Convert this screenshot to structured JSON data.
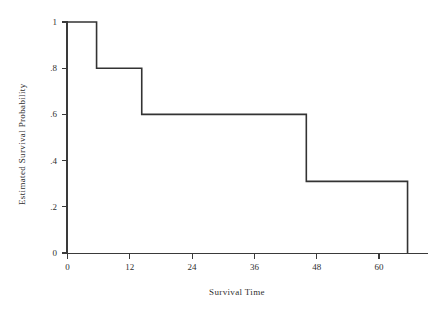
{
  "chart_data": {
    "type": "line",
    "subtype": "kaplan-meier-step",
    "title": "",
    "xlabel": "Survival Time",
    "ylabel": "Estimated Survival Probability",
    "xlim": [
      -2,
      68
    ],
    "ylim": [
      0,
      1.05
    ],
    "xticks": [
      0,
      12,
      24,
      36,
      48,
      60
    ],
    "xtick_labels": [
      "0",
      "12",
      "24",
      "36",
      "48",
      "60"
    ],
    "yticks": [
      0,
      0.2,
      0.4,
      0.6,
      0.8,
      1
    ],
    "ytick_labels": [
      "0",
      ".2",
      ".4",
      ".6",
      ".8",
      "1"
    ],
    "grid": false,
    "legend": false,
    "legend_position": "none",
    "series": [
      {
        "name": "Estimated Survival Probability",
        "color": "#333333",
        "step": "post",
        "x": [
          0,
          5.6,
          5.6,
          14.3,
          14.3,
          46.0,
          46.0,
          65.5,
          65.5
        ],
        "y": [
          1.0,
          1.0,
          0.8,
          0.8,
          0.6,
          0.6,
          0.31,
          0.31,
          0.0
        ]
      }
    ],
    "step_points": [
      {
        "time": 0,
        "survival": 1.0
      },
      {
        "time": 5.6,
        "survival": 0.8
      },
      {
        "time": 14.3,
        "survival": 0.6
      },
      {
        "time": 46.0,
        "survival": 0.31
      },
      {
        "time": 65.5,
        "survival": 0.0
      }
    ]
  },
  "axes": {
    "x_title": "Survival Time",
    "y_title": "Estimated Survival Probability"
  }
}
